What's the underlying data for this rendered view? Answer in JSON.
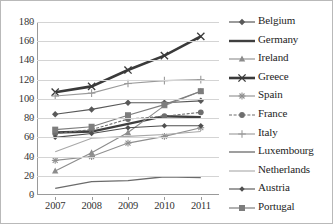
{
  "chart_data": {
    "type": "line",
    "title": "",
    "xlabel": "",
    "ylabel": "",
    "categories": [
      "2007",
      "2008",
      "2009",
      "2010",
      "2011"
    ],
    "x": [
      2007,
      2008,
      2009,
      2010,
      2011
    ],
    "ylim": [
      0,
      180
    ],
    "yticks": [
      0,
      20,
      40,
      60,
      80,
      100,
      120,
      140,
      160,
      180
    ],
    "ytick_labels": [
      "0",
      "20",
      "40",
      "60",
      "80",
      "100",
      "120",
      "140",
      "160",
      "180"
    ],
    "grid": true,
    "legend_position": "right",
    "series": [
      {
        "name": "Belgium",
        "marker": "diamond",
        "color": "#595959",
        "line_width": 1.2,
        "dash": "none",
        "values": [
          84,
          89,
          96,
          96,
          98
        ]
      },
      {
        "name": "Germany",
        "marker": "none",
        "color": "#3f3f3f",
        "line_width": 2.4,
        "dash": "none",
        "values": [
          65,
          66,
          74,
          82,
          81
        ]
      },
      {
        "name": "Ireland",
        "marker": "triangle",
        "color": "#8c8c8c",
        "line_width": 1.1,
        "dash": "none",
        "values": [
          25,
          44,
          65,
          93,
          108
        ]
      },
      {
        "name": "Greece",
        "marker": "x",
        "color": "#3a3a3a",
        "line_width": 2.6,
        "dash": "none",
        "values": [
          107,
          113,
          130,
          145,
          165
        ]
      },
      {
        "name": "Spain",
        "marker": "star",
        "color": "#8f8f8f",
        "line_width": 1.1,
        "dash": "none",
        "values": [
          36,
          40,
          54,
          61,
          70
        ]
      },
      {
        "name": "France",
        "marker": "circle",
        "color": "#6e6e6e",
        "line_width": 1.1,
        "dash": "dotted",
        "values": [
          64,
          68,
          79,
          82,
          86
        ]
      },
      {
        "name": "Italy",
        "marker": "plus",
        "color": "#9a9a9a",
        "line_width": 1.1,
        "dash": "none",
        "values": [
          103,
          106,
          116,
          119,
          120
        ]
      },
      {
        "name": "Luxembourg",
        "marker": "none",
        "color": "#6b6b6b",
        "line_width": 1.3,
        "dash": "none",
        "values": [
          7,
          14,
          15,
          19,
          18
        ]
      },
      {
        "name": "Netherlands",
        "marker": "none",
        "color": "#a8a8a8",
        "line_width": 1.1,
        "dash": "none",
        "values": [
          45,
          59,
          61,
          63,
          66
        ]
      },
      {
        "name": "Austria",
        "marker": "diamond-small",
        "color": "#4f4f4f",
        "line_width": 1.1,
        "dash": "none",
        "values": [
          60,
          64,
          70,
          72,
          72
        ]
      },
      {
        "name": "Portugal",
        "marker": "square",
        "color": "#7d7d7d",
        "line_width": 1.2,
        "dash": "none",
        "values": [
          68,
          71,
          83,
          94,
          108
        ]
      }
    ]
  },
  "legend": {
    "items": [
      {
        "label": "Belgium"
      },
      {
        "label": "Germany"
      },
      {
        "label": "Ireland"
      },
      {
        "label": "Greece"
      },
      {
        "label": "Spain"
      },
      {
        "label": "France"
      },
      {
        "label": "Italy"
      },
      {
        "label": "Luxembourg"
      },
      {
        "label": "Netherlands"
      },
      {
        "label": "Austria"
      },
      {
        "label": "Portugal"
      }
    ]
  },
  "colors": {
    "gridline": "#d4d4d4",
    "axis": "#9a9a9a",
    "border": "#b9b9b9",
    "text": "#2b2b2b"
  }
}
